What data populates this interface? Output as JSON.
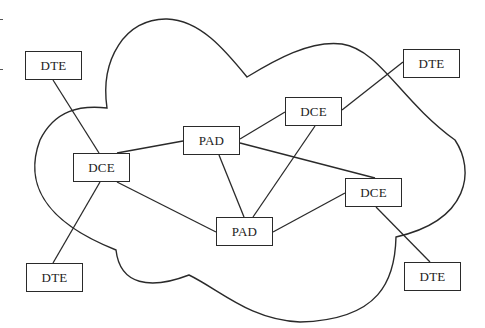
{
  "diagram": {
    "type": "network-topology",
    "style": {
      "line_color": "#2a2a2a",
      "background": "#ffffff",
      "text_color": "#222222"
    },
    "nodes": [
      {
        "id": "dte1",
        "label": "DTE",
        "x": 25,
        "y": 51,
        "w": 57,
        "h": 29
      },
      {
        "id": "dce1",
        "label": "DCE",
        "x": 73,
        "y": 153,
        "w": 57,
        "h": 29
      },
      {
        "id": "pad1",
        "label": "PAD",
        "x": 183,
        "y": 126,
        "w": 57,
        "h": 29
      },
      {
        "id": "dce2",
        "label": "DCE",
        "x": 285,
        "y": 97,
        "w": 57,
        "h": 29
      },
      {
        "id": "dte2",
        "label": "DTE",
        "x": 403,
        "y": 49,
        "w": 57,
        "h": 29
      },
      {
        "id": "dce3",
        "label": "DCE",
        "x": 345,
        "y": 178,
        "w": 57,
        "h": 29
      },
      {
        "id": "pad2",
        "label": "PAD",
        "x": 216,
        "y": 217,
        "w": 57,
        "h": 29
      },
      {
        "id": "dte3",
        "label": "DTE",
        "x": 26,
        "y": 263,
        "w": 57,
        "h": 29
      },
      {
        "id": "dte4",
        "label": "DTE",
        "x": 404,
        "y": 262,
        "w": 57,
        "h": 29
      }
    ],
    "edges": [
      {
        "from": "dte1",
        "to": "dce1",
        "x1": 53,
        "y1": 80,
        "x2": 99,
        "y2": 153
      },
      {
        "from": "dce1",
        "to": "pad1",
        "x1": 117,
        "y1": 153,
        "x2": 183,
        "y2": 141
      },
      {
        "from": "dce1",
        "to": "pad2",
        "x1": 117,
        "y1": 182,
        "x2": 216,
        "y2": 232
      },
      {
        "from": "dce1",
        "to": "dte3",
        "x1": 100,
        "y1": 182,
        "x2": 53,
        "y2": 263
      },
      {
        "from": "pad1",
        "to": "dce2",
        "x1": 240,
        "y1": 139,
        "x2": 285,
        "y2": 112
      },
      {
        "from": "pad1",
        "to": "pad2",
        "x1": 219,
        "y1": 155,
        "x2": 244,
        "y2": 217
      },
      {
        "from": "pad1",
        "to": "dce3",
        "x1": 240,
        "y1": 143,
        "x2": 375,
        "y2": 178
      },
      {
        "from": "dce2",
        "to": "pad2",
        "x1": 315,
        "y1": 126,
        "x2": 253,
        "y2": 217
      },
      {
        "from": "dce2",
        "to": "dte2",
        "x1": 342,
        "y1": 110,
        "x2": 403,
        "y2": 62
      },
      {
        "from": "pad2",
        "to": "dce3",
        "x1": 273,
        "y1": 232,
        "x2": 345,
        "y2": 193
      },
      {
        "from": "dce3",
        "to": "dte4",
        "x1": 376,
        "y1": 207,
        "x2": 430,
        "y2": 262
      }
    ],
    "cloud_path": "M 107 108 C 100 60, 125 18, 167 19 C 200 20, 225 50, 247 77 C 275 60, 310 40, 342 44 C 380 50, 400 100, 455 140 C 475 170, 470 220, 396 237 C 395 280, 380 320, 300 322 C 250 320, 220 290, 189 275 C 150 290, 120 285, 116 250 C 40 220, 25 180, 40 140 C 55 110, 80 105, 107 108 Z",
    "margin_ticks": [
      {
        "x": 0,
        "y": 19,
        "w": 3
      },
      {
        "x": 0,
        "y": 69,
        "w": 3
      }
    ]
  }
}
